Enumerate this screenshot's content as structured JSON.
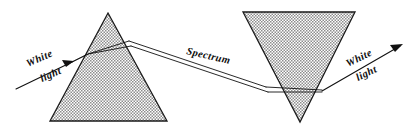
{
  "figure": {
    "background_color": "#ffffff",
    "ink_color": "#111111",
    "prism_fill_color": "#b4b4b4",
    "width": 410,
    "height": 132
  },
  "labels": {
    "incoming_white": {
      "line1": "White",
      "line2": "light"
    },
    "spectrum": {
      "text": "Spectrum"
    },
    "outgoing_white": {
      "line1": "White",
      "line2": "light"
    }
  },
  "prisms": [
    {
      "name": "left-prism",
      "orientation": "apex-up",
      "points": "108,13 167,121 50,121"
    },
    {
      "name": "right-prism",
      "orientation": "apex-down",
      "points": "243,12 355,12 300,122"
    }
  ],
  "rays": {
    "incoming": {
      "name": "incoming-white-light-ray",
      "path": "M 16,89 L 72,62"
    },
    "incoming_arrow": {
      "name": "incoming-arrow-head",
      "points": "74,61 62,60 66,67"
    },
    "inside_left_upper": {
      "name": "left-prism-internal-ray-upper",
      "path": "M 72,62 L 88,54 L 129,41"
    },
    "inside_left_lower": {
      "name": "left-prism-internal-ray-lower",
      "path": "M 72,62 L 88,54 L 131,46"
    },
    "spectrum_upper": {
      "name": "spectrum-ray-upper",
      "path": "M 129,41 L 266,87"
    },
    "spectrum_lower": {
      "name": "spectrum-ray-lower",
      "path": "M 131,46 L 268,92"
    },
    "inside_right_upper": {
      "name": "right-prism-internal-ray-upper",
      "path": "M 266,87 L 322,90"
    },
    "inside_right_lower": {
      "name": "right-prism-internal-ray-lower",
      "path": "M 268,92 L 322,92"
    },
    "outgoing": {
      "name": "outgoing-white-light-ray",
      "path": "M 322,91 L 400,46"
    },
    "outgoing_arrow": {
      "name": "outgoing-arrow-head",
      "points": "403,44 390,45 395,52"
    }
  }
}
